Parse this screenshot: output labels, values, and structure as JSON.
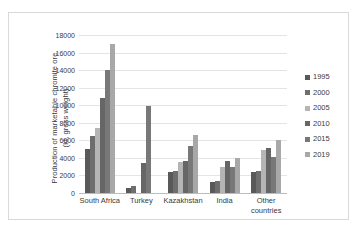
{
  "chart_data": {
    "type": "bar",
    "title": "",
    "xlabel": "",
    "ylabel": "Production of marketable chromite ore (kt, gross weight)",
    "ylabel_line1": "Production of marketable chromite ore",
    "ylabel_line2": "(kt, gross weight)",
    "ylim": [
      0,
      18000
    ],
    "ytick_step": 2000,
    "yticks": [
      "0",
      "2000",
      "4000",
      "6000",
      "8000",
      "10000",
      "12000",
      "14000",
      "16000",
      "18000"
    ],
    "grid": true,
    "legend_position": "right",
    "categories": [
      "South Africa",
      "Turkey",
      "Kazakhstan",
      "India",
      "Other\ncountries"
    ],
    "series": [
      {
        "name": "1995",
        "color": "#595959",
        "values": [
          5000,
          600,
          2350,
          1200,
          2400
        ]
      },
      {
        "name": "2000",
        "color": "#6e6e6e",
        "values": [
          6550,
          850,
          2500,
          1400,
          2550
        ]
      },
      {
        "name": "2005",
        "color": "#b5b5b5",
        "values": [
          7400,
          0,
          3500,
          3000,
          4850
        ]
      },
      {
        "name": "2010",
        "color": "#666666",
        "values": [
          10800,
          3450,
          3700,
          3700,
          5100
        ]
      },
      {
        "name": "2015",
        "color": "#787878",
        "values": [
          14000,
          9900,
          5350,
          3000,
          4100
        ]
      },
      {
        "name": "2019",
        "color": "#a8a8a8",
        "values": [
          17000,
          0,
          6600,
          4000,
          6050
        ]
      }
    ]
  },
  "legend": {
    "items": [
      {
        "label": "1995"
      },
      {
        "label": "2000"
      },
      {
        "label": "2005"
      },
      {
        "label": "2010"
      },
      {
        "label": "2015"
      },
      {
        "label": "2019"
      }
    ]
  }
}
